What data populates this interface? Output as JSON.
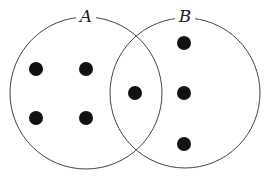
{
  "diagram": {
    "type": "venn",
    "sets": [
      {
        "label": "A",
        "cx": 86,
        "cy": 93,
        "r": 76,
        "label_x": 86,
        "label_y": 22
      },
      {
        "label": "B",
        "cx": 185,
        "cy": 93,
        "r": 75,
        "label_x": 185,
        "label_y": 22
      }
    ],
    "elements": [
      {
        "region": "A only",
        "x": 36,
        "y": 69
      },
      {
        "region": "A only",
        "x": 86,
        "y": 69
      },
      {
        "region": "A only",
        "x": 36,
        "y": 118
      },
      {
        "region": "A only",
        "x": 86,
        "y": 118
      },
      {
        "region": "A and B",
        "x": 135,
        "y": 93
      },
      {
        "region": "B only",
        "x": 184,
        "y": 43
      },
      {
        "region": "B only",
        "x": 184,
        "y": 93
      },
      {
        "region": "B only",
        "x": 184,
        "y": 144
      }
    ],
    "counts": {
      "A_only": 4,
      "A_and_B": 1,
      "B_only": 3
    },
    "colors": {
      "stroke": "#444444",
      "dot": "#111111",
      "background": "#ffffff"
    }
  }
}
